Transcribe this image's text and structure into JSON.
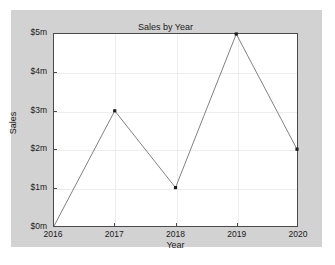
{
  "chart_data": {
    "type": "line",
    "title": "Sales by Year",
    "xlabel": "Year",
    "ylabel": "Sales",
    "categories": [
      "2016",
      "2017",
      "2018",
      "2019",
      "2020"
    ],
    "x": [
      2016,
      2017,
      2018,
      2019,
      2020
    ],
    "values": [
      0,
      3,
      1,
      5,
      2
    ],
    "value_unit": "$m",
    "xtick_labels": [
      "2016",
      "2017",
      "2018",
      "2019",
      "2020"
    ],
    "ytick_labels": [
      "$0m",
      "$1m",
      "$2m",
      "$3m",
      "$4m",
      "$5m"
    ],
    "ytick_values": [
      0,
      1,
      2,
      3,
      4,
      5
    ],
    "xlim": [
      2016,
      2020
    ],
    "ylim": [
      0,
      5
    ],
    "grid": true,
    "legend": null,
    "legend_position": "none",
    "series": [
      {
        "name": "Sales",
        "values": [
          0,
          3,
          1,
          5,
          2
        ],
        "line_color": "#808080",
        "marker_color": "#1a1a1a",
        "marker": "square"
      }
    ],
    "colors": {
      "figure_background": "#d2d2d2",
      "plot_background": "#ffffff",
      "axis": "#4a4a4a",
      "gridline": "#ededed",
      "line": "#808080",
      "marker": "#1a1a1a",
      "text": "#1a1a1a"
    }
  }
}
